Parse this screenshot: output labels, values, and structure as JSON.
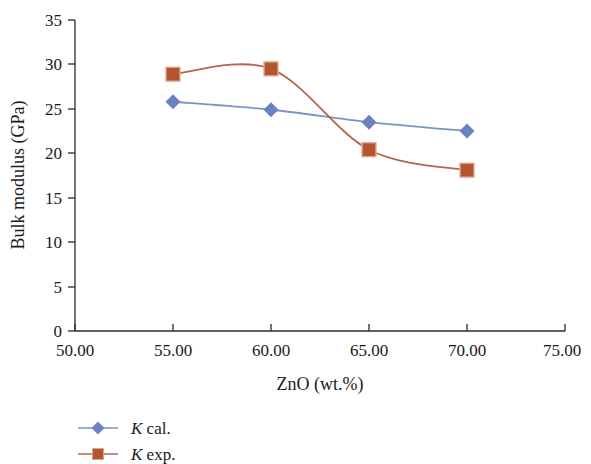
{
  "chart_data": {
    "type": "line",
    "title": "",
    "xlabel": "ZnO (wt.%)",
    "ylabel": "Bulk modulus (GPa)",
    "x": [
      55.0,
      60.0,
      65.0,
      70.0
    ],
    "xlim": [
      50.0,
      75.0
    ],
    "ylim": [
      0,
      35
    ],
    "xticks": [
      "50.00",
      "55.00",
      "60.00",
      "65.00",
      "70.00",
      "75.00"
    ],
    "xtick_values": [
      50,
      55,
      60,
      65,
      70,
      75
    ],
    "yticks": [
      "0",
      "5",
      "10",
      "15",
      "20",
      "25",
      "30",
      "35"
    ],
    "ytick_values": [
      0,
      5,
      10,
      15,
      20,
      25,
      30,
      35
    ],
    "grid": false,
    "legend_position": "below-left",
    "smoothing": "spline",
    "series": [
      {
        "name": "K cal.",
        "marker": "diamond",
        "color": "#7d93c8",
        "marker_color": "#6a82c0",
        "values": [
          25.8,
          24.9,
          23.5,
          22.5
        ]
      },
      {
        "name": "K exp.",
        "marker": "square",
        "color": "#b4644a",
        "marker_color": "#b5542f",
        "values": [
          28.9,
          29.5,
          20.4,
          18.1
        ]
      }
    ]
  },
  "legend": {
    "items": [
      {
        "symbol_name": "diamond-marker",
        "label_italic": "K",
        "label_rest": " cal."
      },
      {
        "symbol_name": "square-marker",
        "label_italic": "K",
        "label_rest": " exp."
      }
    ]
  },
  "axes": {
    "x_title": "ZnO (wt.%)",
    "y_title": "Bulk modulus (GPa)",
    "x_tick_labels": [
      "50.00",
      "55.00",
      "60.00",
      "65.00",
      "70.00",
      "75.00"
    ],
    "y_tick_labels": [
      "35",
      "30",
      "25",
      "20",
      "15",
      "10",
      "5",
      "0"
    ]
  }
}
